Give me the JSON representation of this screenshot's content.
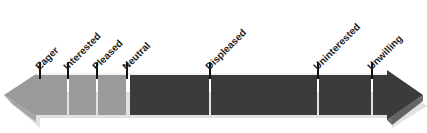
{
  "diagram": {
    "type": "bidirectional-arrow-scale",
    "orientation": "horizontal",
    "background_color": "#ffffff",
    "bar": {
      "left_arrowhead_color": "#9a9a9a",
      "right_arrowhead_color": "#3b3b3b",
      "positive_segment_color": "#9b9b9b",
      "negative_segment_color": "#3b3b3b",
      "divider_color": "#ffffff",
      "shadow_color": "#d8d8d8",
      "top_y": 75,
      "bottom_y": 115,
      "left_tip_x": 4,
      "right_tip_x": 423,
      "body_left_x": 36,
      "body_right_x": 386
    },
    "tick": {
      "color": "#111111",
      "width": 2,
      "top_y": 62,
      "bottom_y": 78
    },
    "labels_rotation_deg": -45,
    "ticks": [
      {
        "label": "Eager",
        "x": 40,
        "tone": "positive"
      },
      {
        "label": "Interested",
        "x": 68,
        "tone": "positive"
      },
      {
        "label": "Pleased",
        "x": 97,
        "tone": "positive"
      },
      {
        "label": "Neutral",
        "x": 127,
        "tone": "neutral"
      },
      {
        "label": "Displeased",
        "x": 210,
        "tone": "negative"
      },
      {
        "label": "Uninterested",
        "x": 318,
        "tone": "negative"
      },
      {
        "label": "Unwilling",
        "x": 372,
        "tone": "negative"
      }
    ],
    "segments": [
      {
        "name": "eager-to-interested",
        "from_x": 36,
        "to_x": 68,
        "color": "#9b9b9b"
      },
      {
        "name": "interested-to-pleased",
        "from_x": 68,
        "to_x": 97,
        "color": "#9b9b9b"
      },
      {
        "name": "pleased-to-neutral",
        "from_x": 97,
        "to_x": 127,
        "color": "#9b9b9b"
      },
      {
        "name": "neutral-to-displeased",
        "from_x": 130,
        "to_x": 210,
        "color": "#3b3b3b"
      },
      {
        "name": "displeased-to-uninterested",
        "from_x": 212,
        "to_x": 318,
        "color": "#3b3b3b"
      },
      {
        "name": "uninterested-to-unwilling",
        "from_x": 320,
        "to_x": 372,
        "color": "#3b3b3b"
      },
      {
        "name": "unwilling-to-end",
        "from_x": 374,
        "to_x": 386,
        "color": "#3b3b3b"
      }
    ]
  }
}
